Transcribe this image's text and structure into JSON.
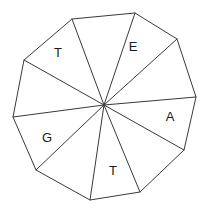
{
  "figure": {
    "name": "labeled-decagon-sectors",
    "shape_type": "decagon",
    "sides": 10,
    "sector_count": 10,
    "center": {
      "x": 104,
      "y": 105
    },
    "stroke_color": "#3a3a3a",
    "fill_color": "#ffffff",
    "text_color": "#1a1a1a",
    "vertices": [
      {
        "index": 0,
        "x": 135,
        "y": 13
      },
      {
        "index": 1,
        "x": 177,
        "y": 39
      },
      {
        "index": 2,
        "x": 196,
        "y": 97
      },
      {
        "index": 3,
        "x": 184,
        "y": 150
      },
      {
        "index": 4,
        "x": 140,
        "y": 192
      },
      {
        "index": 5,
        "x": 90,
        "y": 200
      },
      {
        "index": 6,
        "x": 36,
        "y": 170
      },
      {
        "index": 7,
        "x": 13,
        "y": 117
      },
      {
        "index": 8,
        "x": 24,
        "y": 60
      },
      {
        "index": 9,
        "x": 72,
        "y": 19
      }
    ],
    "sectors": [
      {
        "id": "sector-1",
        "label": "",
        "x": 150,
        "y": 52
      },
      {
        "id": "sector-2",
        "label": "A",
        "x": 170,
        "y": 118
      },
      {
        "id": "sector-3",
        "label": "",
        "x": 150,
        "y": 160
      },
      {
        "id": "sector-4",
        "label": "T",
        "x": 113,
        "y": 172
      },
      {
        "id": "sector-5",
        "label": "",
        "x": 70,
        "y": 168
      },
      {
        "id": "sector-6",
        "label": "G",
        "x": 47,
        "y": 139
      },
      {
        "id": "sector-7",
        "label": "",
        "x": 45,
        "y": 92
      },
      {
        "id": "sector-8",
        "label": "T",
        "x": 58,
        "y": 54
      },
      {
        "id": "sector-9",
        "label": "",
        "x": 95,
        "y": 40
      },
      {
        "id": "sector-10",
        "label": "E",
        "x": 133,
        "y": 48
      }
    ],
    "labels": [
      {
        "text": "T",
        "x": 58,
        "y": 54
      },
      {
        "text": "E",
        "x": 133,
        "y": 48
      },
      {
        "text": "A",
        "x": 170,
        "y": 118
      },
      {
        "text": "T",
        "x": 113,
        "y": 172
      },
      {
        "text": "G",
        "x": 47,
        "y": 139
      }
    ]
  }
}
